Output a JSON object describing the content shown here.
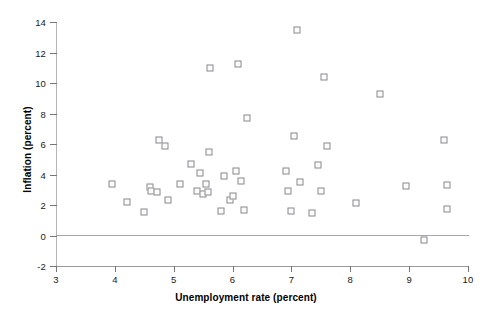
{
  "chart_data": {
    "type": "scatter",
    "title": "",
    "xlabel": "Unemployment rate (percent)",
    "ylabel": "Inflation (percent)",
    "xlim": [
      3,
      10
    ],
    "ylim": [
      -2,
      14
    ],
    "xticks": [
      3,
      4,
      5,
      6,
      7,
      8,
      9,
      10
    ],
    "xtick_labels": [
      "3",
      "4",
      "5",
      "6",
      "7",
      "8",
      "9",
      "10"
    ],
    "yticks": [
      -2,
      0,
      2,
      4,
      6,
      8,
      10,
      12,
      14
    ],
    "ytick_labels": [
      "-2",
      "0",
      "2",
      "4",
      "6",
      "8",
      "10",
      "12",
      "14"
    ],
    "grid": false,
    "legend": null,
    "marker": "open-square",
    "marker_color": "#8a8a8f",
    "zero_reference_line": 0,
    "points": [
      {
        "x": 3.95,
        "y": 3.4
      },
      {
        "x": 4.2,
        "y": 2.2
      },
      {
        "x": 4.5,
        "y": 1.55
      },
      {
        "x": 4.6,
        "y": 3.2
      },
      {
        "x": 4.62,
        "y": 2.9
      },
      {
        "x": 4.72,
        "y": 2.85
      },
      {
        "x": 4.75,
        "y": 6.25
      },
      {
        "x": 4.85,
        "y": 5.9
      },
      {
        "x": 4.9,
        "y": 2.35
      },
      {
        "x": 5.1,
        "y": 3.4
      },
      {
        "x": 5.3,
        "y": 4.7
      },
      {
        "x": 5.4,
        "y": 2.95
      },
      {
        "x": 5.45,
        "y": 4.1
      },
      {
        "x": 5.5,
        "y": 2.75
      },
      {
        "x": 5.55,
        "y": 3.35
      },
      {
        "x": 5.58,
        "y": 2.85
      },
      {
        "x": 5.6,
        "y": 5.5
      },
      {
        "x": 5.62,
        "y": 11.0
      },
      {
        "x": 5.8,
        "y": 1.6
      },
      {
        "x": 5.85,
        "y": 3.9
      },
      {
        "x": 5.95,
        "y": 2.35
      },
      {
        "x": 6.0,
        "y": 2.6
      },
      {
        "x": 6.05,
        "y": 4.25
      },
      {
        "x": 6.1,
        "y": 11.25
      },
      {
        "x": 6.15,
        "y": 3.6
      },
      {
        "x": 6.2,
        "y": 1.65
      },
      {
        "x": 6.25,
        "y": 7.7
      },
      {
        "x": 6.9,
        "y": 4.25
      },
      {
        "x": 6.95,
        "y": 2.95
      },
      {
        "x": 7.0,
        "y": 1.6
      },
      {
        "x": 7.05,
        "y": 6.5
      },
      {
        "x": 7.1,
        "y": 13.5
      },
      {
        "x": 7.15,
        "y": 3.5
      },
      {
        "x": 7.35,
        "y": 1.45
      },
      {
        "x": 7.45,
        "y": 4.6
      },
      {
        "x": 7.5,
        "y": 2.95
      },
      {
        "x": 7.55,
        "y": 10.4
      },
      {
        "x": 7.6,
        "y": 5.85
      },
      {
        "x": 8.1,
        "y": 2.15
      },
      {
        "x": 8.5,
        "y": 9.25
      },
      {
        "x": 8.95,
        "y": 3.25
      },
      {
        "x": 9.25,
        "y": -0.3
      },
      {
        "x": 9.6,
        "y": 6.25
      },
      {
        "x": 9.65,
        "y": 3.3
      },
      {
        "x": 9.65,
        "y": 1.75
      }
    ]
  }
}
